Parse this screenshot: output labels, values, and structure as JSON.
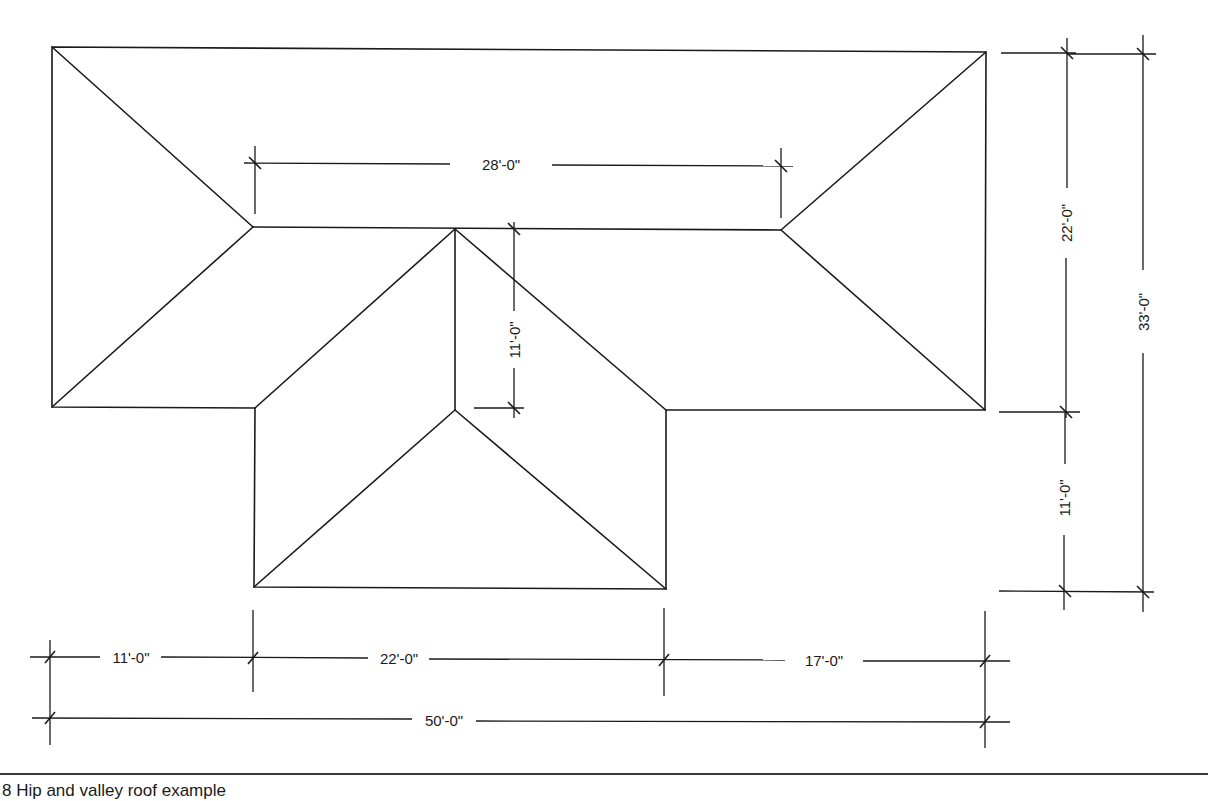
{
  "figure": {
    "caption": "8    Hip and valley roof example",
    "line_color": "#1a1a1a",
    "background": "#ffffff"
  },
  "dimensions": {
    "ridge_length": "28'-0\"",
    "wing_ridge_length": "11'-0\"",
    "main_depth": "22'-0\"",
    "overall_depth": "33'-0\"",
    "wing_projection": "11'-0\"",
    "left_offset": "11'-0\"",
    "wing_width": "22'-0\"",
    "right_offset": "17'-0\"",
    "overall_width": "50'-0\""
  },
  "roof": {
    "main_outline": [
      [
        52,
        47
      ],
      [
        986,
        52
      ],
      [
        985,
        410
      ],
      [
        666,
        410
      ],
      [
        666,
        589
      ],
      [
        254,
        587
      ],
      [
        255,
        408
      ],
      [
        52,
        407
      ]
    ],
    "ridges": [
      {
        "name": "main-ridge",
        "from": [
          253,
          227
        ],
        "to": [
          781,
          230
        ]
      },
      {
        "name": "wing-ridge",
        "from": [
          455,
          229
        ],
        "to": [
          455,
          410
        ]
      }
    ],
    "hips": [
      {
        "from": [
          52,
          47
        ],
        "to": [
          253,
          227
        ]
      },
      {
        "from": [
          52,
          407
        ],
        "to": [
          253,
          227
        ]
      },
      {
        "from": [
          986,
          52
        ],
        "to": [
          781,
          230
        ]
      },
      {
        "from": [
          985,
          410
        ],
        "to": [
          781,
          230
        ]
      },
      {
        "from": [
          455,
          410
        ],
        "to": [
          254,
          587
        ]
      },
      {
        "from": [
          455,
          410
        ],
        "to": [
          666,
          589
        ]
      }
    ],
    "valleys": [
      {
        "from": [
          455,
          229
        ],
        "to": [
          255,
          408
        ]
      },
      {
        "from": [
          455,
          229
        ],
        "to": [
          666,
          410
        ]
      }
    ]
  }
}
